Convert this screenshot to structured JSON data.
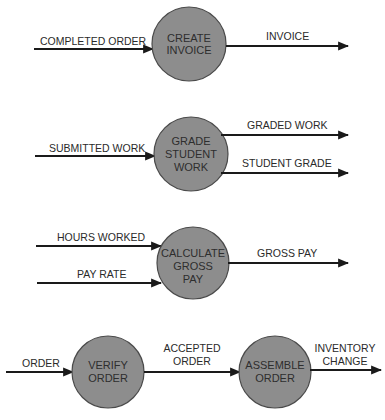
{
  "colors": {
    "process_fill": "#8d8d8d",
    "process_stroke": "#4a4a4a",
    "line": "#1a1a1a",
    "text": "#2a2a2a",
    "background": "#ffffff"
  },
  "diagrams": [
    {
      "process": {
        "lines": [
          "CREATE",
          "INVOICE"
        ]
      },
      "inputs": [
        {
          "label": "COMPLETED ORDER"
        }
      ],
      "outputs": [
        {
          "label": "INVOICE"
        }
      ]
    },
    {
      "process": {
        "lines": [
          "GRADE",
          "STUDENT",
          "WORK"
        ]
      },
      "inputs": [
        {
          "label": "SUBMITTED WORK"
        }
      ],
      "outputs": [
        {
          "label": "GRADED WORK"
        },
        {
          "label": "STUDENT GRADE"
        }
      ]
    },
    {
      "process": {
        "lines": [
          "CALCULATE",
          "GROSS",
          "PAY"
        ]
      },
      "inputs": [
        {
          "label": "HOURS WORKED"
        },
        {
          "label": "PAY RATE"
        }
      ],
      "outputs": [
        {
          "label": "GROSS PAY"
        }
      ]
    },
    {
      "processes": [
        {
          "lines": [
            "VERIFY",
            "ORDER"
          ]
        },
        {
          "lines": [
            "ASSEMBLE",
            "ORDER"
          ]
        }
      ],
      "inputs": [
        {
          "label": "ORDER"
        }
      ],
      "intermediate": {
        "lines": [
          "ACCEPTED",
          "ORDER"
        ]
      },
      "outputs": [
        {
          "lines": [
            "INVENTORY",
            "CHANGE"
          ]
        }
      ]
    }
  ]
}
